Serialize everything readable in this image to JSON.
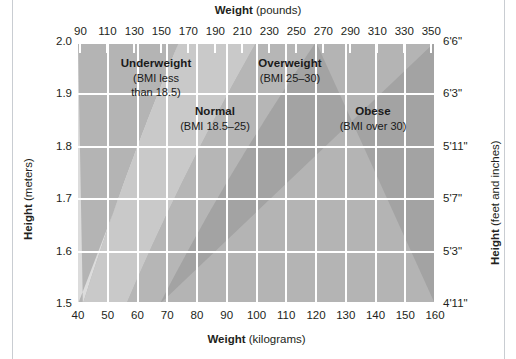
{
  "figure": {
    "title_top": {
      "bold": "Weight",
      "rest": " (pounds)"
    },
    "title_bottom": {
      "bold": "Weight",
      "rest": " (kilograms)"
    },
    "title_left": {
      "bold": "Height",
      "rest": " (meters)"
    },
    "title_right": {
      "bold": "Height",
      "rest": " (feet and inches)"
    }
  },
  "chart_data": {
    "type": "heatmap",
    "xlabel": "Weight (kilograms)",
    "ylabel": "Height (meters)",
    "x2label": "Weight (pounds)",
    "y2label": "Height (feet and inches)",
    "grid": true,
    "legend": "none",
    "xlim": [
      40,
      160
    ],
    "ylim": [
      1.5,
      2.0
    ],
    "x_ticks_kg": [
      40,
      50,
      60,
      70,
      80,
      90,
      100,
      110,
      120,
      130,
      140,
      150,
      160
    ],
    "x_ticks_lb": [
      90,
      110,
      130,
      150,
      170,
      190,
      210,
      230,
      250,
      270,
      290,
      310,
      330,
      350
    ],
    "y_ticks_m": [
      "2.0",
      "1.9",
      "1.8",
      "1.7",
      "1.6",
      "1.5"
    ],
    "y_ticks_ft": [
      "6'6\"",
      "6'3\"",
      "5'11\"",
      "5'7\"",
      "5'3\"",
      "4'11\""
    ],
    "zones": [
      {
        "name": "Underweight",
        "detail_line1": "(BMI less",
        "detail_line2": "than 18.5)",
        "bmi_max": 18.5,
        "fill": "#dcdcdc"
      },
      {
        "name": "Normal",
        "detail_line1": "(BMI 18.5–25)",
        "detail_line2": "",
        "bmi_min": 18.5,
        "bmi_max": 25,
        "fill": "#c9c9c9"
      },
      {
        "name": "Overweight",
        "detail_line1": "(BMI 25–30)",
        "detail_line2": "",
        "bmi_min": 25,
        "bmi_max": 30,
        "fill": "#b6b6b6"
      },
      {
        "name": "Obese",
        "detail_line1": "(BMI over 30)",
        "detail_line2": "",
        "bmi_min": 30,
        "fill": "#a3a3a3"
      }
    ],
    "boundary_curves": [
      {
        "bmi": 18.5,
        "formula": "weight = 18.5 * height^2"
      },
      {
        "bmi": 25,
        "formula": "weight = 25 * height^2"
      },
      {
        "bmi": 30,
        "formula": "weight = 30 * height^2"
      }
    ]
  },
  "colors": {
    "underweight": "#dcdcdc",
    "normal": "#c9c9c9",
    "overweight": "#b6b6b6",
    "obese": "#a3a3a3",
    "gridline": "#ffffff",
    "text": "#231f20",
    "page_rule": "#c9cdd2"
  }
}
